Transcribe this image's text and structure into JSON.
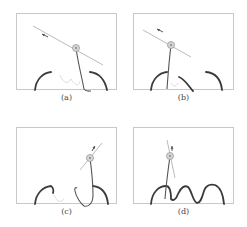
{
  "figure": {
    "colors": {
      "frame": "#c8c8c8",
      "cable": "#555555",
      "bump": "#3a3a3a",
      "faint_bump": "#dddddd",
      "tangent": "#bbbbbb",
      "node": "#999999",
      "arrow": "#555555"
    },
    "panels": [
      {
        "caption": "(a)",
        "node": [
          60,
          35
        ],
        "tangent": [
          [
            -43,
            -22
          ],
          [
            27,
            17
          ]
        ],
        "arrow": [
          [
            32,
            24
          ],
          [
            26,
            21
          ]
        ],
        "cable": "M60,35 C62,50 66,65 68,76 C70,79 73,78 75,78",
        "bumps": [
          "M19,77 C20,66 27,60 35,59",
          "M74,59 C83,60 89,67 91,77"
        ],
        "faint": "M44,62 C47,70 52,72 55,66 C58,72 63,74 64,68"
      },
      {
        "caption": "(b)",
        "node": [
          38,
          32
        ],
        "tangent": [
          [
            -28,
            -15
          ],
          [
            20,
            12
          ]
        ],
        "arrow": [
          [
            30,
            19
          ],
          [
            24,
            16
          ]
        ],
        "cable": "M38,32 C36,48 35,62 34,76",
        "bumps": [
          "M18,77 C19,66 26,60 34,59",
          "M46,64 C52,66 56,74 60,78",
          "M73,59 C83,60 88,67 89,77"
        ],
        "faint": "M38,70 C40,74 43,74 45,70"
      },
      {
        "caption": "(c)",
        "node": [
          74,
          31
        ],
        "tangent": [
          [
            -10,
            12
          ],
          [
            12,
            -15
          ]
        ],
        "arrow": [
          [
            76,
            24
          ],
          [
            79,
            19
          ]
        ],
        "cable": "M74,31 C76,46 77,58 77,68 C77,78 71,80 68,79 C65,77 60,70 59,64 C58,61 60,60 61,61",
        "bumps": [
          "M19,77 C20,66 27,60 35,59 C37,60 38,64 37,66",
          "M77,59 C86,60 91,67 92,77"
        ],
        "faint": "M38,68 C41,75 45,76 48,72"
      },
      {
        "caption": "(d)",
        "node": [
          37,
          29
        ],
        "tangent": [
          [
            -3,
            -16
          ],
          [
            5,
            22
          ]
        ],
        "arrow": [
          [
            39,
            24
          ],
          [
            39,
            19
          ]
        ],
        "cable": "M37,29 C35,44 33,58 32,72",
        "bumps": [
          "M18,77 C19,65 26,59 33,59 C36,59 38,64 38,72 C40,74 43,73 45,67 C48,60 52,58 55,60 C59,64 60,75 64,76 C68,76 69,70 71,64 C73,58 78,57 82,58 C87,60 90,67 91,77"
        ],
        "faint": ""
      }
    ]
  }
}
